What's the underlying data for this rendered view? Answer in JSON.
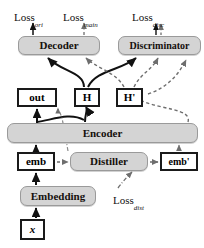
{
  "diagram": {
    "colors": {
      "module_fill": "#d4d4d4",
      "module_stroke": "#9a9a9a",
      "tensor_fill": "#ffffff",
      "tensor_stroke": "#1a1a1a",
      "edge_solid": "#111111",
      "edge_dashed": "#6e6e6e",
      "background": "#ffffff",
      "text": "#15100c"
    },
    "losses": [
      {
        "id": "loss-ori",
        "base": "Loss",
        "sub": "ori",
        "x": 14,
        "y": 8,
        "arrow": "solid"
      },
      {
        "id": "loss-main",
        "base": "Loss",
        "sub": "main",
        "x": 66,
        "y": 8,
        "arrow": "dashed"
      },
      {
        "id": "loss-disc",
        "base": "Loss",
        "sub": "disc",
        "x": 134,
        "y": 8,
        "arrow": "solid-and-dashed"
      },
      {
        "id": "loss-dist",
        "base": "Loss",
        "sub": "dist",
        "x": 113,
        "y": 190,
        "arrow": "dash-dot"
      }
    ],
    "modules": [
      {
        "id": "decoder",
        "label": "Decoder",
        "x": 18,
        "y": 36,
        "w": 82,
        "h": 19,
        "font": 11
      },
      {
        "id": "discriminator",
        "label": "Discriminator",
        "x": 118,
        "y": 36,
        "w": 83,
        "h": 19,
        "font": 10
      },
      {
        "id": "encoder",
        "label": "Encoder",
        "x": 7,
        "y": 123,
        "w": 191,
        "h": 20,
        "font": 11
      },
      {
        "id": "distiller",
        "label": "Distiller",
        "x": 70,
        "y": 152,
        "w": 78,
        "h": 19,
        "font": 11
      },
      {
        "id": "embedding",
        "label": "Embedding",
        "x": 20,
        "y": 186,
        "w": 76,
        "h": 20,
        "font": 11
      }
    ],
    "tensors": [
      {
        "id": "out",
        "label": "out",
        "x": 17,
        "y": 88,
        "w": 40,
        "h": 19,
        "font": 11
      },
      {
        "id": "h",
        "label": "H",
        "x": 74,
        "y": 88,
        "w": 26,
        "h": 19,
        "font": 11
      },
      {
        "id": "hprime",
        "label": "H'",
        "x": 116,
        "y": 88,
        "w": 27,
        "h": 19,
        "font": 11
      },
      {
        "id": "emb",
        "label": "emb",
        "x": 17,
        "y": 152,
        "w": 38,
        "h": 19,
        "font": 11
      },
      {
        "id": "embp",
        "label": "emb'",
        "x": 160,
        "y": 152,
        "w": 38,
        "h": 19,
        "font": 10
      },
      {
        "id": "x",
        "label": "x",
        "x": 20,
        "y": 219,
        "w": 25,
        "h": 21,
        "font": 11
      }
    ]
  }
}
